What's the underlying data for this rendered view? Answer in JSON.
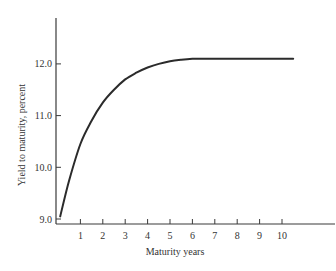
{
  "chart_data": {
    "type": "line",
    "title": "",
    "xlabel": "Maturity years",
    "ylabel": "Yield to maturity, percent",
    "xlim": [
      0,
      11.4
    ],
    "ylim": [
      8.9,
      12.9
    ],
    "x_ticks": [
      1,
      2,
      3,
      4,
      5,
      6,
      7,
      8,
      9,
      10
    ],
    "x_tick_labels": [
      "1",
      "2",
      "3",
      "4",
      "5",
      "6",
      "7",
      "8",
      "9",
      "10"
    ],
    "y_ticks": [
      9.0,
      10.0,
      11.0,
      12.0
    ],
    "y_tick_labels": [
      "9.0",
      "10.0",
      "11.0",
      "12.0"
    ],
    "grid": false,
    "legend": null,
    "series": [
      {
        "name": "Yield curve",
        "x": [
          0.1,
          0.5,
          1.0,
          1.5,
          2.0,
          2.5,
          3.0,
          3.5,
          4.0,
          4.5,
          5.0,
          5.5,
          6.0,
          6.5,
          7.0,
          8.0,
          9.0,
          10.0,
          10.5
        ],
        "values": [
          9.05,
          9.75,
          10.45,
          10.9,
          11.25,
          11.5,
          11.7,
          11.83,
          11.93,
          12.0,
          12.05,
          12.08,
          12.1,
          12.1,
          12.1,
          12.1,
          12.1,
          12.1,
          12.1
        ]
      }
    ]
  },
  "colors": {
    "line": "#2b2b2b",
    "axis": "#3a3a3a",
    "background": "#ffffff"
  }
}
